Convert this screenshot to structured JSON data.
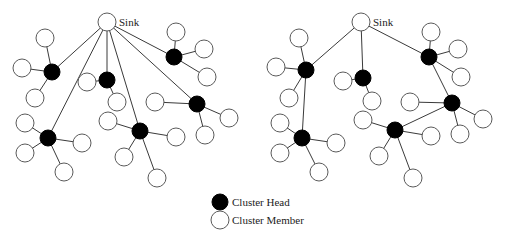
{
  "figure": {
    "width": 508,
    "height": 238,
    "colors": {
      "cluster_head_fill": "#000000",
      "cluster_member_fill": "#ffffff",
      "node_stroke": "#5a5a5a",
      "edge": "#3a3a3a",
      "text": "#222222"
    },
    "node_radius": {
      "member": 9,
      "head": 8
    }
  },
  "diagrams": [
    {
      "name": "direct-to-sink",
      "sink": {
        "label": "Sink",
        "x": 107,
        "y": 22,
        "label_x": 119,
        "label_y": 26
      },
      "clusters": [
        {
          "head": {
            "x": 52,
            "y": 72
          },
          "uplink": "sink",
          "members": [
            {
              "x": 45,
              "y": 38
            },
            {
              "x": 22,
              "y": 68
            },
            {
              "x": 35,
              "y": 98
            }
          ]
        },
        {
          "head": {
            "x": 107,
            "y": 80
          },
          "uplink": "sink",
          "members": [
            {
              "x": 87,
              "y": 82
            },
            {
              "x": 117,
              "y": 102
            }
          ]
        },
        {
          "head": {
            "x": 174,
            "y": 57
          },
          "uplink": "sink",
          "members": [
            {
              "x": 176,
              "y": 32
            },
            {
              "x": 204,
              "y": 49
            },
            {
              "x": 207,
              "y": 77
            }
          ]
        },
        {
          "head": {
            "x": 197,
            "y": 104
          },
          "uplink": "sink",
          "members": [
            {
              "x": 155,
              "y": 102
            },
            {
              "x": 229,
              "y": 118
            },
            {
              "x": 205,
              "y": 135
            }
          ]
        },
        {
          "head": {
            "x": 48,
            "y": 138
          },
          "uplink": "sink",
          "members": [
            {
              "x": 25,
              "y": 123
            },
            {
              "x": 25,
              "y": 153
            },
            {
              "x": 82,
              "y": 143
            },
            {
              "x": 64,
              "y": 172
            }
          ]
        },
        {
          "head": {
            "x": 140,
            "y": 131
          },
          "uplink": "sink",
          "members": [
            {
              "x": 108,
              "y": 121
            },
            {
              "x": 124,
              "y": 157
            },
            {
              "x": 176,
              "y": 137
            },
            {
              "x": 157,
              "y": 178
            }
          ]
        }
      ]
    },
    {
      "name": "multi-hop",
      "sink": {
        "label": "Sink",
        "x": 361,
        "y": 22,
        "label_x": 373,
        "label_y": 26
      },
      "clusters": [
        {
          "head": {
            "x": 306,
            "y": 70
          },
          "uplink": "sink",
          "members": [
            {
              "x": 299,
              "y": 38
            },
            {
              "x": 276,
              "y": 67
            },
            {
              "x": 289,
              "y": 98
            }
          ]
        },
        {
          "head": {
            "x": 363,
            "y": 78
          },
          "uplink": "sink",
          "members": [
            {
              "x": 343,
              "y": 81
            },
            {
              "x": 372,
              "y": 101
            }
          ]
        },
        {
          "head": {
            "x": 429,
            "y": 57
          },
          "uplink": "sink",
          "members": [
            {
              "x": 431,
              "y": 32
            },
            {
              "x": 458,
              "y": 49
            },
            {
              "x": 461,
              "y": 77
            }
          ]
        },
        {
          "head": {
            "x": 452,
            "y": 103
          },
          "uplink": 2,
          "members": [
            {
              "x": 410,
              "y": 102
            },
            {
              "x": 483,
              "y": 119
            },
            {
              "x": 460,
              "y": 134
            }
          ]
        },
        {
          "head": {
            "x": 302,
            "y": 138
          },
          "uplink": 0,
          "members": [
            {
              "x": 280,
              "y": 123
            },
            {
              "x": 280,
              "y": 153
            },
            {
              "x": 336,
              "y": 143
            },
            {
              "x": 319,
              "y": 172
            }
          ]
        },
        {
          "head": {
            "x": 395,
            "y": 130
          },
          "uplink": 3,
          "members": [
            {
              "x": 363,
              "y": 120
            },
            {
              "x": 379,
              "y": 156
            },
            {
              "x": 431,
              "y": 136
            },
            {
              "x": 413,
              "y": 178
            }
          ]
        }
      ]
    }
  ],
  "legend": {
    "items": [
      {
        "label": "Cluster Head",
        "type": "head",
        "x": 220,
        "y": 202,
        "text_x": 232,
        "text_y": 206
      },
      {
        "label": "Cluster Member",
        "type": "member",
        "x": 220,
        "y": 220,
        "text_x": 232,
        "text_y": 224
      }
    ]
  }
}
